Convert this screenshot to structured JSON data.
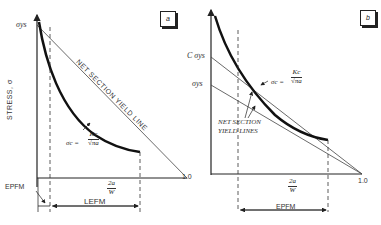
{
  "panel_a": {
    "tag": "a",
    "y_label": "STRESS, σ",
    "y_tick": "σys",
    "x_end": "1.0",
    "x_label_num": "2a",
    "x_label_den": "W",
    "line_label": "NET SECTION YIELD LINE",
    "curve_label_lhs": "σc =",
    "curve_label_num": "Kc",
    "curve_label_den": "√πa",
    "region_epfm": "EPFM",
    "region_lefm": "LEFM"
  },
  "panel_b": {
    "tag": "b",
    "y_tick_upper": "C σys",
    "y_tick_lower": "σys",
    "x_end": "1.0",
    "x_label_num": "2a",
    "x_label_den": "W",
    "line_label_1": "NET SECTION",
    "line_label_2": "YIELD LINES",
    "curve_label_lhs": "σc =",
    "curve_label_num": "Kc",
    "curve_label_den": "√πa",
    "region_epfm": "EPFM"
  }
}
